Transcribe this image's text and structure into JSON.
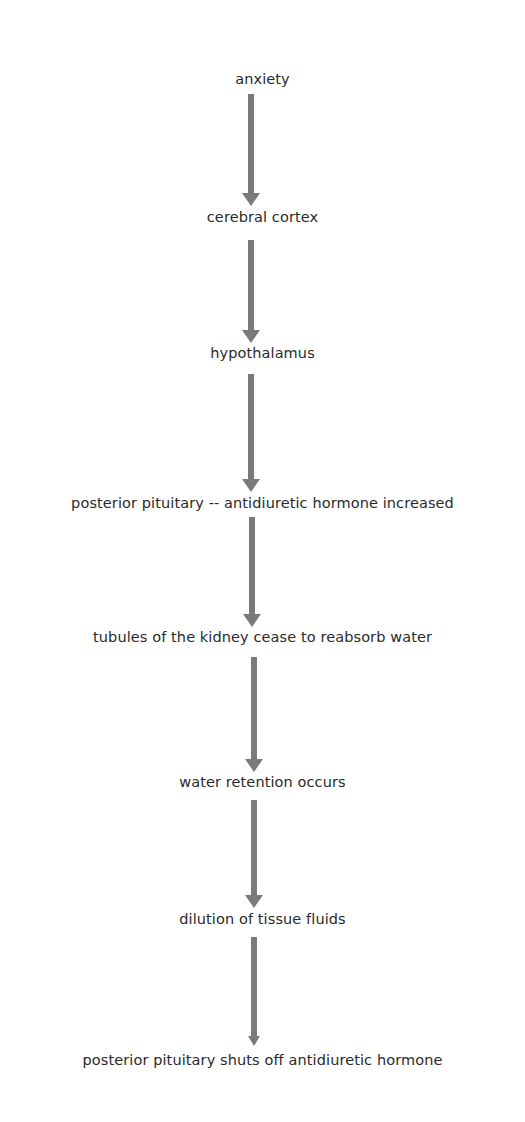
{
  "diagram": {
    "type": "flowchart",
    "direction": "top-to-bottom",
    "arrow_color": "#7a7a7a",
    "nodes": [
      {
        "label": "anxiety"
      },
      {
        "label": "cerebral cortex"
      },
      {
        "label": "hypothalamus"
      },
      {
        "label": "posterior pituitary -- antidiuretic hormone increased"
      },
      {
        "label": "tubules of the kidney cease to reabsorb water"
      },
      {
        "label": "water retention occurs"
      },
      {
        "label": "dilution of tissue fluids"
      },
      {
        "label": "posterior pituitary shuts off antidiuretic hormone"
      }
    ],
    "edges": [
      {
        "from": "anxiety",
        "to": "cerebral cortex"
      },
      {
        "from": "cerebral cortex",
        "to": "hypothalamus"
      },
      {
        "from": "hypothalamus",
        "to": "posterior pituitary -- antidiuretic hormone increased"
      },
      {
        "from": "posterior pituitary -- antidiuretic hormone increased",
        "to": "tubules of the kidney cease to reabsorb water"
      },
      {
        "from": "tubules of the kidney cease to reabsorb water",
        "to": "water retention occurs"
      },
      {
        "from": "water retention occurs",
        "to": "dilution of tissue fluids"
      },
      {
        "from": "dilution of tissue fluids",
        "to": "posterior pituitary shuts off antidiuretic hormone"
      }
    ]
  }
}
